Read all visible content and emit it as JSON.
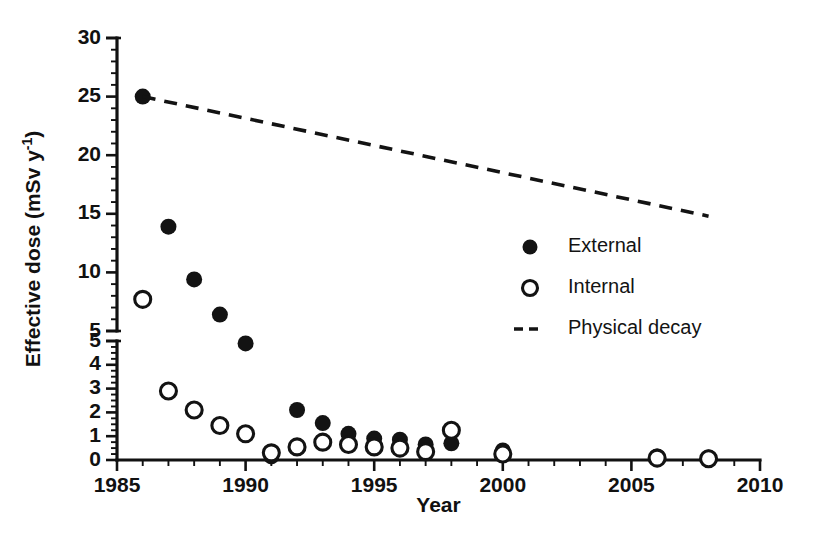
{
  "chart_data": {
    "type": "scatter",
    "title": "",
    "xlabel": "Year",
    "ylabel": "Effective dose (mSv y",
    "ylabel_sup": "-1",
    "ylabel_close": ")",
    "xlim": [
      1985,
      2010
    ],
    "xticks": [
      1985,
      1990,
      1995,
      2000,
      2005,
      2010
    ],
    "xtick_labels": [
      "1985",
      "1990",
      "1995",
      "2000",
      "2005",
      "2010"
    ],
    "x_minor_step": 1,
    "grid": false,
    "broken_axis": true,
    "y_lower_lim": [
      0,
      5
    ],
    "y_lower_ticks": [
      0,
      1,
      2,
      3,
      4,
      5
    ],
    "y_lower_tick_labels": [
      "0",
      "1",
      "2",
      "3",
      "4",
      "5"
    ],
    "y_upper_lim": [
      5,
      30
    ],
    "y_upper_ticks": [
      5,
      10,
      15,
      20,
      25,
      30
    ],
    "y_upper_tick_labels": [
      "5",
      "10",
      "15",
      "20",
      "25",
      "30"
    ],
    "legend_position": "center-right",
    "series": [
      {
        "name": "External",
        "marker": "filled-circle",
        "color": "#131313",
        "x": [
          1986,
          1987,
          1988,
          1989,
          1990,
          1991,
          1992,
          1993,
          1994,
          1995,
          1996,
          1997,
          1998,
          2000,
          2006,
          2008
        ],
        "values": [
          25.0,
          13.9,
          9.4,
          6.4,
          4.9,
          0.15,
          2.1,
          1.55,
          1.1,
          0.9,
          0.85,
          0.65,
          0.7,
          0.4,
          0.15,
          0.1
        ]
      },
      {
        "name": "Internal",
        "marker": "open-circle",
        "color": "#131313",
        "x": [
          1986,
          1987,
          1988,
          1989,
          1990,
          1991,
          1992,
          1993,
          1994,
          1995,
          1996,
          1997,
          1998,
          2000,
          2006,
          2008
        ],
        "values": [
          7.7,
          2.9,
          2.1,
          1.45,
          1.1,
          0.3,
          0.55,
          0.75,
          0.65,
          0.55,
          0.5,
          0.35,
          1.25,
          0.25,
          0.08,
          0.05
        ]
      },
      {
        "name": "Physical decay",
        "marker": "dashed-line",
        "color": "#131313",
        "x": [
          1986,
          2008
        ],
        "values": [
          25.0,
          14.8
        ]
      }
    ],
    "legend": [
      {
        "label": "External",
        "marker": "filled-circle"
      },
      {
        "label": "Internal",
        "marker": "open-circle"
      },
      {
        "label": "Physical decay",
        "marker": "dashed-line"
      }
    ]
  }
}
